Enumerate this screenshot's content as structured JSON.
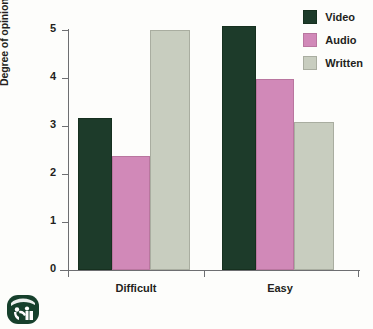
{
  "chart_data": {
    "type": "bar",
    "title": "",
    "subtitle": "",
    "xlabel": "",
    "ylabel": "Degree of opinion change",
    "categories": [
      "Difficult",
      "Easy"
    ],
    "series": [
      {
        "name": "Video",
        "color": "#1d3b2a",
        "values": [
          3.17,
          5.08
        ]
      },
      {
        "name": "Audio",
        "color": "#d189b8",
        "values": [
          2.38,
          3.98
        ]
      },
      {
        "name": "Written",
        "color": "#c8cdbf",
        "values": [
          5.0,
          3.08
        ]
      }
    ],
    "ylim": [
      0,
      5
    ],
    "ytick_labels": [
      "0",
      "1",
      "2",
      "3",
      "4",
      "5"
    ],
    "ytick_values": [
      0,
      1,
      2,
      3,
      4,
      5
    ],
    "grid": false,
    "legend_position": "top-right"
  },
  "legend": {
    "items": [
      {
        "label": "Video"
      },
      {
        "label": "Audio"
      },
      {
        "label": "Written"
      }
    ]
  },
  "axes": {
    "y_title": "Degree of opinion change",
    "y_ticks": [
      "0",
      "1",
      "2",
      "3",
      "4",
      "5"
    ],
    "x_groups": [
      "Difficult",
      "Easy"
    ]
  },
  "logo": {
    "name": "publisher-logo"
  }
}
